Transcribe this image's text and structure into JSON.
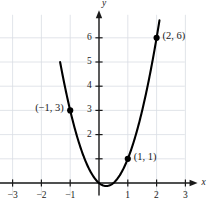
{
  "chart_data": {
    "type": "line",
    "title": "",
    "xlabel": "x",
    "ylabel": "y",
    "xlim": [
      -3.6,
      3.6
    ],
    "ylim": [
      -1.2,
      7.2
    ],
    "grid": true,
    "legend": null,
    "curve": {
      "name": "parabola",
      "equation": "y = 2x^2 - x",
      "color": "#000000",
      "x_start": -1.35,
      "x_end": 2.1
    },
    "x_ticks": [
      -3,
      -2,
      -1,
      1,
      2,
      3
    ],
    "x_tick_labels": [
      "−3",
      "−2",
      "−1",
      "1",
      "2",
      "3"
    ],
    "y_ticks": [
      1,
      2,
      3,
      4,
      5,
      6
    ],
    "y_tick_labels": [
      "",
      "2",
      "3",
      "4",
      "5",
      "6"
    ],
    "points": [
      {
        "x": -1,
        "y": 3,
        "label": "(−1, 3)",
        "label_side": "left"
      },
      {
        "x": 1,
        "y": 1,
        "label": "(1, 1)",
        "label_side": "right"
      },
      {
        "x": 2,
        "y": 6,
        "label": "(2, 6)",
        "label_side": "right"
      }
    ],
    "axis_color": "#1a1a1a",
    "grid_color": "#d9dde3",
    "curve_color": "#000000"
  },
  "axes": {
    "x_name": "x",
    "y_name": "y"
  }
}
